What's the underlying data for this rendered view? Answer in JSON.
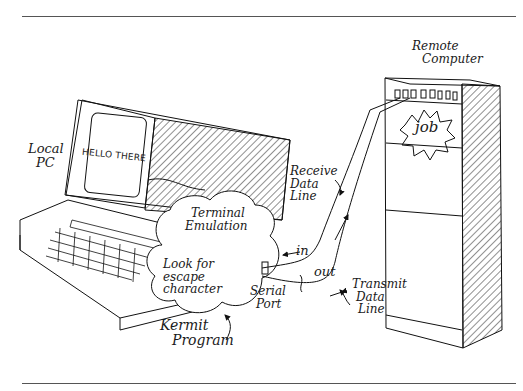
{
  "figure": {
    "labels": {
      "remote_computer": [
        "Remote",
        "Computer"
      ],
      "job": "job",
      "local_pc": [
        "Local",
        "PC"
      ],
      "screen_text": "HELLO THERE",
      "terminal_emulation": [
        "Terminal",
        "Emulation"
      ],
      "look_for_escape": [
        "Look for",
        "escape",
        "character"
      ],
      "kermit_program": [
        "Kermit",
        "Program"
      ],
      "serial_port": [
        "Serial",
        "Port"
      ],
      "receive_data_line": [
        "Receive",
        "Data",
        "Line"
      ],
      "transmit_data_line": [
        "Transmit",
        "Data",
        "Line"
      ],
      "in": "in",
      "out": "out"
    }
  }
}
